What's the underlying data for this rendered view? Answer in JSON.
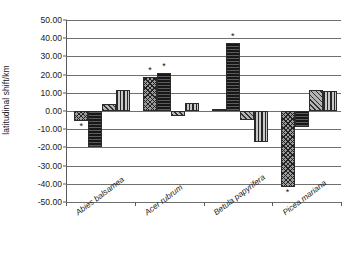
{
  "chart_data": {
    "type": "bar",
    "title": "",
    "xlabel": "",
    "ylabel": "latitudinal shift/km",
    "ylim": [
      -50,
      50
    ],
    "ytick_step": 10,
    "ytick_labels": [
      "50.00",
      "40.00",
      "30.00",
      "20.00",
      "10.00",
      "0.00",
      "-10.00",
      "-20.00",
      "-30.00",
      "-40.00",
      "-50.00"
    ],
    "grid": true,
    "legend": "none",
    "categories": [
      "Abies balsamea",
      "Acer rubrum",
      "Betula papyrifera",
      "Picea mariana"
    ],
    "series": [
      {
        "name": "series-1",
        "pattern": "cross-hatch",
        "values": [
          -5.5,
          18.5,
          1.2,
          -41.5
        ]
      },
      {
        "name": "series-2",
        "pattern": "solid-black",
        "values": [
          -19.8,
          21.0,
          37.2,
          -9.0
        ]
      },
      {
        "name": "series-3",
        "pattern": "diagonal-hatch",
        "values": [
          4.0,
          -2.5,
          -5.0,
          11.3
        ]
      },
      {
        "name": "series-4",
        "pattern": "vertical-stripes",
        "values": [
          11.3,
          4.2,
          -17.0,
          10.8
        ]
      }
    ],
    "significance_markers": [
      {
        "category": "Abies balsamea",
        "series": "series-1",
        "value": -5.5,
        "symbol": "*",
        "placement": "below"
      },
      {
        "category": "Acer rubrum",
        "series": "series-1",
        "value": 18.5,
        "symbol": "*",
        "placement": "above"
      },
      {
        "category": "Acer rubrum",
        "series": "series-2",
        "value": 21.0,
        "symbol": "*",
        "placement": "above"
      },
      {
        "category": "Betula papyrifera",
        "series": "series-2",
        "value": 37.2,
        "symbol": "*",
        "placement": "above"
      },
      {
        "category": "Picea mariana",
        "series": "series-1",
        "value": -41.5,
        "symbol": "*",
        "placement": "below"
      }
    ]
  }
}
